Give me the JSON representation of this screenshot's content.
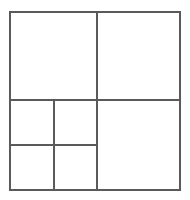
{
  "figure": {
    "type": "geometric-line-diagram",
    "canvas": {
      "width": 190,
      "height": 200,
      "background_color": "#ffffff"
    },
    "style": {
      "line_color": "#5a5a5a",
      "outer_line_width": 1.6,
      "inner_line_width": 1.5,
      "fill_color": "#ffffff"
    },
    "outer_square": {
      "label": "outer-square",
      "x": 10,
      "y": 12,
      "width": 170,
      "height": 178
    },
    "dividers": [
      {
        "name": "main-horizontal-divider",
        "orientation": "horizontal",
        "x1": 10,
        "y1": 100,
        "x2": 180,
        "y2": 100
      },
      {
        "name": "main-vertical-divider",
        "orientation": "vertical",
        "x1": 97,
        "y1": 12,
        "x2": 97,
        "y2": 190
      },
      {
        "name": "lower-left-vertical-divider",
        "orientation": "vertical",
        "x1": 54,
        "y1": 100,
        "x2": 54,
        "y2": 190
      },
      {
        "name": "lower-left-horizontal-divider",
        "orientation": "horizontal",
        "x1": 10,
        "y1": 145,
        "x2": 97,
        "y2": 145
      }
    ],
    "cells": [
      {
        "name": "cell-top-left",
        "x": 10,
        "y": 12,
        "width": 87,
        "height": 88,
        "text": ""
      },
      {
        "name": "cell-top-right",
        "x": 97,
        "y": 12,
        "width": 83,
        "height": 88,
        "text": ""
      },
      {
        "name": "cell-mid-left",
        "x": 10,
        "y": 100,
        "width": 44,
        "height": 45,
        "text": ""
      },
      {
        "name": "cell-mid-center",
        "x": 54,
        "y": 100,
        "width": 43,
        "height": 45,
        "text": ""
      },
      {
        "name": "cell-bottom-left",
        "x": 10,
        "y": 145,
        "width": 44,
        "height": 45,
        "text": ""
      },
      {
        "name": "cell-bottom-center",
        "x": 54,
        "y": 145,
        "width": 43,
        "height": 45,
        "text": ""
      },
      {
        "name": "cell-bottom-right-large",
        "x": 97,
        "y": 100,
        "width": 83,
        "height": 90,
        "text": ""
      }
    ],
    "cell_count": 7
  }
}
